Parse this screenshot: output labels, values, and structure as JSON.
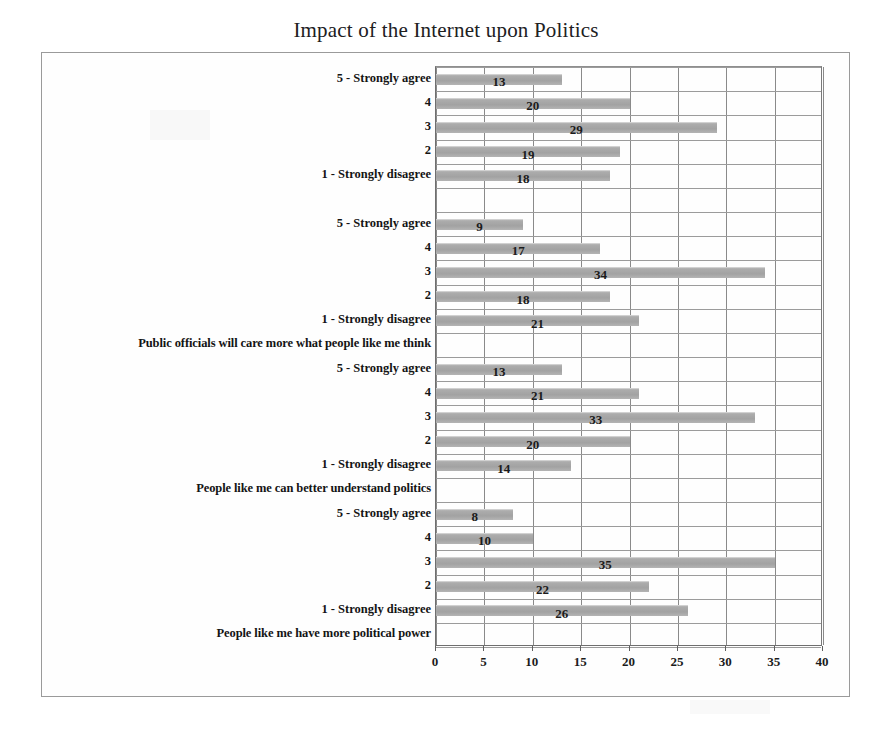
{
  "chart_data": {
    "type": "bar",
    "orientation": "horizontal",
    "title": "Impact of the Internet upon Politics",
    "xlabel": "",
    "ylabel": "",
    "xlim": [
      0,
      40
    ],
    "xticks": [
      0,
      5,
      10,
      15,
      20,
      25,
      30,
      35,
      40
    ],
    "xtick_labels": [
      "0",
      "5",
      "10",
      "15",
      "20",
      "25",
      "30",
      "35",
      "40"
    ],
    "grid": true,
    "grid_axis": "both",
    "legend": false,
    "legend_position": "none",
    "bar_color": "#a8a8a8",
    "data_labels": true,
    "categories": [
      "5 - Strongly agree",
      "4",
      "3",
      "2",
      "1 - Strongly disagree"
    ],
    "groups": [
      {
        "label": "",
        "categories": [
          "5 - Strongly agree",
          "4",
          "3",
          "2",
          "1 - Strongly disagree"
        ],
        "values": [
          13,
          20,
          29,
          19,
          18
        ]
      },
      {
        "label": "Public officials will care more what people like me think",
        "categories": [
          "5 - Strongly agree",
          "4",
          "3",
          "2",
          "1 - Strongly disagree"
        ],
        "values": [
          9,
          17,
          34,
          18,
          21
        ]
      },
      {
        "label": "People like me can better understand politics",
        "categories": [
          "5 - Strongly agree",
          "4",
          "3",
          "2",
          "1 - Strongly disagree"
        ],
        "values": [
          13,
          21,
          33,
          20,
          14
        ]
      },
      {
        "label": "People like me have more political power",
        "categories": [
          "5 - Strongly agree",
          "4",
          "3",
          "2",
          "1 - Strongly disagree"
        ],
        "values": [
          8,
          10,
          35,
          22,
          26
        ]
      }
    ]
  }
}
